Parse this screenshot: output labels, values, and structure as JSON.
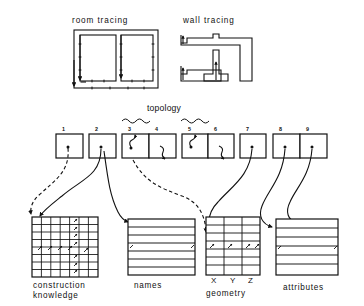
{
  "diagram": {
    "title_room_tracing": "room tracing",
    "title_wall_tracing": "wall tracing",
    "title_topology": "topology"
  },
  "cells": {
    "numbers": [
      "1",
      "2",
      "3",
      "4",
      "5",
      "6",
      "7",
      "8",
      "9"
    ],
    "groups": [
      {
        "label": "1",
        "cells": [
          "1"
        ]
      },
      {
        "label": "2",
        "cells": [
          "2"
        ]
      },
      {
        "label": "3-4",
        "cells": [
          "3",
          "4"
        ]
      },
      {
        "label": "5-6",
        "cells": [
          "5",
          "6"
        ]
      },
      {
        "label": "7",
        "cells": [
          "7"
        ]
      },
      {
        "label": "8-9",
        "cells": [
          "8",
          "9"
        ]
      }
    ],
    "topology_braces": [
      "3-4",
      "5-6"
    ]
  },
  "tables": [
    {
      "name": "construction-knowledge",
      "label_line1": "construction",
      "label_line2": "knowledge",
      "columns": 7,
      "rows": 8,
      "has_vertical_rules": true,
      "column_headers": []
    },
    {
      "name": "names",
      "label_line1": "names",
      "label_line2": "",
      "columns": 1,
      "rows": 7,
      "has_vertical_rules": false,
      "column_headers": []
    },
    {
      "name": "geometry",
      "label_line1": "geometry",
      "label_line2": "",
      "columns": 3,
      "rows": 7,
      "has_vertical_rules": true,
      "column_headers": [
        "X",
        "Y",
        "Z"
      ]
    },
    {
      "name": "attributes",
      "label_line1": "attributes",
      "label_line2": "",
      "columns": 1,
      "rows": 6,
      "has_vertical_rules": false,
      "column_headers": []
    }
  ],
  "colors": {
    "ink": "#111111",
    "paper": "#ffffff"
  }
}
